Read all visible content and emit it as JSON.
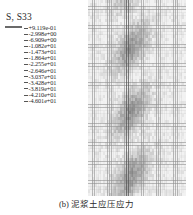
{
  "legend": {
    "title": "S, S33",
    "entries": [
      {
        "value": "+9.119e-01",
        "color": "#3a3a3a"
      },
      {
        "value": "-2.998e+00",
        "color": "#4f4f4f"
      },
      {
        "value": "-6.909e+00",
        "color": "#7b7b7b"
      },
      {
        "value": "-1.082e+01",
        "color": "#9a9a9a"
      },
      {
        "value": "-1.473e+01",
        "color": "#d6d6d6"
      },
      {
        "value": "-1.864e+01",
        "color": "#8e8e8e"
      },
      {
        "value": "-2.255e+01",
        "color": "#777777"
      },
      {
        "value": "-2.646e+01",
        "color": "#8a8a8a"
      },
      {
        "value": "-3.037e+01",
        "color": "#6e6e6e"
      },
      {
        "value": "-3.428e+01",
        "color": "#5c5c5c"
      },
      {
        "value": "-3.819e+01",
        "color": "#6b6b6b"
      },
      {
        "value": "-4.210e+01",
        "color": "#4a4a4a"
      },
      {
        "value": "-4.601e+01",
        "color": "#3d3d3d"
      }
    ]
  },
  "mesh": {
    "description": "finite-element contour mesh",
    "columns": 46,
    "rows": 62,
    "line_color": "#8c8c8c",
    "fill_light": "#f2f2f2",
    "fill_dark": "#7a7a7a",
    "band_center_x": 0.44,
    "band_intensity": 0.72
  },
  "caption": {
    "text": "(b) 泥浆土应压应力"
  }
}
